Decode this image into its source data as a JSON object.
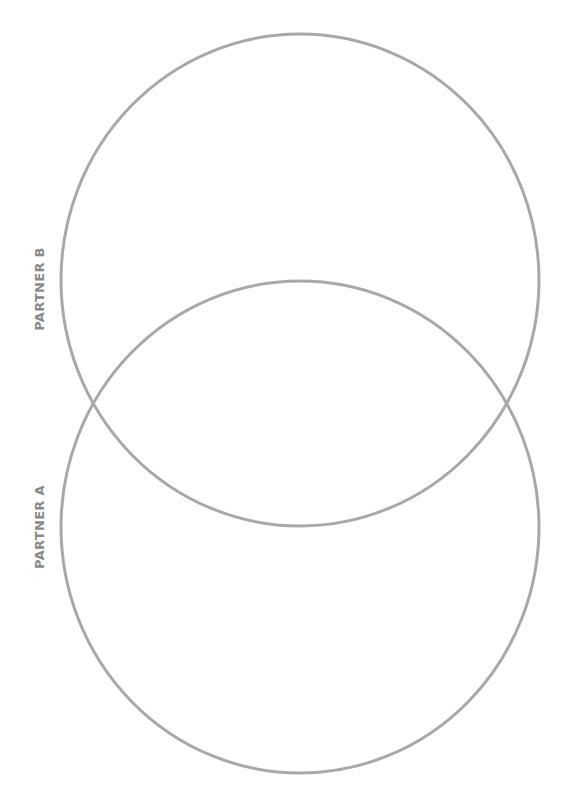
{
  "diagram": {
    "type": "venn",
    "stroke_color": "#a8a8a8",
    "label_color": "#8a8a8a",
    "background": "#ffffff",
    "sets": [
      {
        "id": "partner-b",
        "label": "PARTNER B",
        "position": "top",
        "cx": 300,
        "cy": 280,
        "rx": 239,
        "ry": 246
      },
      {
        "id": "partner-a",
        "label": "PARTNER A",
        "position": "bottom",
        "cx": 300,
        "cy": 527,
        "rx": 239,
        "ry": 246
      }
    ]
  }
}
